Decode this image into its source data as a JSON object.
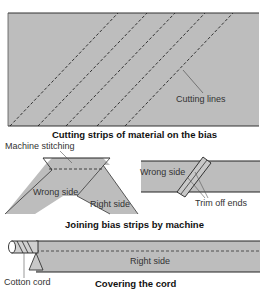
{
  "colors": {
    "fabric": "#bdbdbd",
    "line": "#333333",
    "background": "#ffffff"
  },
  "figure1": {
    "caption": "Cutting strips of material on the bias",
    "callout": "Cutting lines"
  },
  "figure2": {
    "caption": "Joining bias strips by machine",
    "labels": {
      "machine_stitching": "Machine stitching",
      "wrong_side_left": "Wrong side",
      "right_side": "Right side",
      "wrong_side_right": "Wrong side",
      "trim_off_ends": "Trim off ends"
    }
  },
  "figure3": {
    "caption": "Covering the cord",
    "labels": {
      "right_side": "Right side",
      "cotton_cord": "Cotton cord"
    }
  }
}
